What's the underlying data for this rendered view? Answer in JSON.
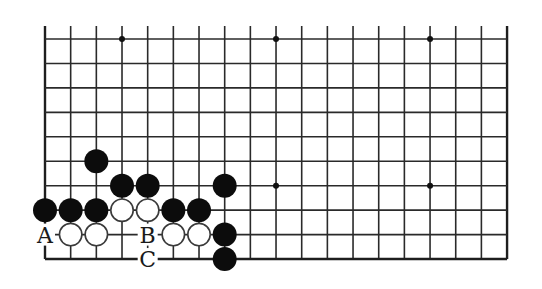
{
  "diagram": {
    "type": "go-board-fragment",
    "grid": {
      "columns": 19,
      "rows": 10,
      "origin_x": 45,
      "origin_y": 39,
      "step_x": 25.67,
      "step_y": 24.45,
      "top_overhang": 13,
      "edges": {
        "left": true,
        "right": true,
        "bottom": true,
        "top": false
      }
    },
    "star_points": [
      {
        "col": 3,
        "row": 0
      },
      {
        "col": 9,
        "row": 0
      },
      {
        "col": 15,
        "row": 0
      },
      {
        "col": 9,
        "row": 6
      },
      {
        "col": 15,
        "row": 6
      }
    ],
    "stones": [
      {
        "color": "black",
        "col": 2,
        "row": 5
      },
      {
        "color": "black",
        "col": 3,
        "row": 6
      },
      {
        "color": "black",
        "col": 4,
        "row": 6
      },
      {
        "color": "black",
        "col": 7,
        "row": 6
      },
      {
        "color": "black",
        "col": 0,
        "row": 7
      },
      {
        "color": "black",
        "col": 1,
        "row": 7
      },
      {
        "color": "black",
        "col": 2,
        "row": 7
      },
      {
        "color": "white",
        "col": 3,
        "row": 7
      },
      {
        "color": "white",
        "col": 4,
        "row": 7
      },
      {
        "color": "black",
        "col": 5,
        "row": 7
      },
      {
        "color": "black",
        "col": 6,
        "row": 7
      },
      {
        "color": "white",
        "col": 1,
        "row": 8
      },
      {
        "color": "white",
        "col": 2,
        "row": 8
      },
      {
        "color": "white",
        "col": 5,
        "row": 8
      },
      {
        "color": "white",
        "col": 6,
        "row": 8
      },
      {
        "color": "black",
        "col": 7,
        "row": 8
      },
      {
        "color": "black",
        "col": 7,
        "row": 9
      }
    ],
    "labels": [
      {
        "text": "A",
        "col": 0,
        "row": 8
      },
      {
        "text": "B",
        "col": 4,
        "row": 8
      },
      {
        "text": "C",
        "col": 4,
        "row": 9
      }
    ],
    "stone_radius": 12,
    "colors": {
      "line": "#2a2a2a",
      "black_stone": "#0c0c0c",
      "white_stone": "#ffffff",
      "background": "#ffffff"
    }
  }
}
